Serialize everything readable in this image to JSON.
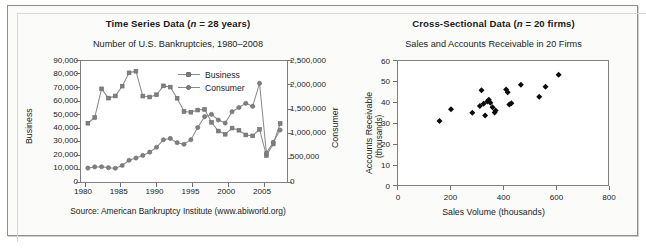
{
  "figure": {
    "width": 646,
    "height": 248,
    "frame_color": "#8e8e8e",
    "background": "#fbfbfa"
  },
  "left_panel": {
    "title_main": "Time Series Data (",
    "title_italic_n": "n",
    "title_tail": " = 28 years)",
    "title_full": "Time Series Data (n = 28 years)",
    "subtitle": "Number of U.S. Bankruptcies, 1980–2008",
    "source": "Source: American Bankruptcy Institute (www.abiworld.org)",
    "legend": [
      {
        "label": "Business",
        "marker": "square",
        "color": "#7d7d7d"
      },
      {
        "label": "Consumer",
        "marker": "circle",
        "color": "#7d7d7d"
      }
    ],
    "y_left_title": "Business",
    "y_right_title": "Consumer",
    "y_left_ticks": [
      "0",
      "10,000",
      "20,000",
      "30,000",
      "40,000",
      "50,000",
      "60,000",
      "70,000",
      "80,000",
      "90,000"
    ],
    "y_right_ticks": [
      "0",
      "500,000",
      "1,000,000",
      "1,500,000",
      "2,000,000",
      "2,500,000"
    ],
    "x_ticks": [
      "1980",
      "1985",
      "1990",
      "1995",
      "2000",
      "2005"
    ]
  },
  "right_panel": {
    "title_main": "Cross-Sectional Data (",
    "title_italic_n": "n",
    "title_tail": " = 20 firms)",
    "title_full": "Cross-Sectional Data (n = 20 firms)",
    "subtitle": "Sales and Accounts Receivable in 20 Firms",
    "y_title_line1": "Accounts Receivable",
    "y_title_line2": "(thousands)",
    "x_title": "Sales Volume (thousands)",
    "y_ticks": [
      "0",
      "10",
      "20",
      "30",
      "40",
      "50",
      "60"
    ],
    "x_ticks": [
      "0",
      "200",
      "400",
      "600",
      "800"
    ]
  },
  "chart_data": [
    {
      "type": "line",
      "title": "Number of U.S. Bankruptcies, 1980–2008",
      "panel_title": "Time Series Data (n = 28 years)",
      "xlabel": "",
      "ylabel": "Business",
      "ylabel_secondary": "Consumer",
      "xlim": [
        1979,
        2009
      ],
      "ylim": [
        0,
        90000
      ],
      "ylim_secondary": [
        0,
        2500000
      ],
      "grid": false,
      "legend_position": "inside-top-center",
      "source": "Source: American Bankruptcy Institute (www.abiworld.org)",
      "x": [
        1980,
        1981,
        1982,
        1983,
        1984,
        1985,
        1986,
        1987,
        1988,
        1989,
        1990,
        1991,
        1992,
        1993,
        1994,
        1995,
        1996,
        1997,
        1998,
        1999,
        2000,
        2001,
        2002,
        2003,
        2004,
        2005,
        2006,
        2007,
        2008
      ],
      "series": [
        {
          "name": "Business",
          "axis": "left",
          "marker": "square",
          "values": [
            43700,
            48000,
            69300,
            62400,
            64000,
            71300,
            81200,
            82400,
            63900,
            63200,
            64900,
            71500,
            70600,
            62300,
            52400,
            51900,
            53500,
            54000,
            44400,
            37900,
            35500,
            40100,
            38500,
            35000,
            34300,
            39200,
            19700,
            28300,
            43500
          ]
        },
        {
          "name": "Consumer",
          "axis": "right",
          "marker": "circle",
          "values": [
            287600,
            312000,
            315000,
            295500,
            284500,
            341000,
            449000,
            495000,
            549000,
            616000,
            718000,
            872000,
            900000,
            812000,
            780000,
            874000,
            1125000,
            1350000,
            1398000,
            1281000,
            1217000,
            1452000,
            1539000,
            1625000,
            1563000,
            2039000,
            598000,
            822000,
            1074000
          ]
        }
      ]
    },
    {
      "type": "scatter",
      "title": "Sales and Accounts Receivable in 20 Firms",
      "panel_title": "Cross-Sectional Data (n = 20 firms)",
      "xlabel": "Sales Volume (thousands)",
      "ylabel": "Accounts Receivable (thousands)",
      "xlim": [
        0,
        800
      ],
      "ylim": [
        0,
        60
      ],
      "grid": false,
      "marker": "diamond",
      "marker_color": "#0c0c0c",
      "x": [
        158,
        202,
        283,
        312,
        318,
        326,
        332,
        340,
        346,
        352,
        360,
        368,
        372,
        412,
        418,
        424,
        432,
        468,
        538,
        562,
        612
      ],
      "y": [
        31.0,
        36.7,
        34.9,
        38.2,
        45.8,
        39.3,
        33.6,
        40.4,
        41.2,
        39.8,
        37.6,
        35.1,
        36.0,
        46.2,
        44.9,
        38.9,
        39.6,
        48.5,
        42.7,
        47.6,
        53.3
      ],
      "points": [
        [
          158,
          31.0
        ],
        [
          202,
          36.7
        ],
        [
          283,
          34.9
        ],
        [
          312,
          38.2
        ],
        [
          318,
          45.8
        ],
        [
          326,
          39.3
        ],
        [
          332,
          33.6
        ],
        [
          340,
          40.4
        ],
        [
          346,
          41.2
        ],
        [
          352,
          39.8
        ],
        [
          360,
          37.6
        ],
        [
          368,
          35.1
        ],
        [
          372,
          36.0
        ],
        [
          412,
          46.2
        ],
        [
          418,
          44.9
        ],
        [
          424,
          38.9
        ],
        [
          432,
          39.6
        ],
        [
          468,
          48.5
        ],
        [
          538,
          42.7
        ],
        [
          562,
          47.6
        ],
        [
          612,
          53.3
        ]
      ]
    }
  ]
}
